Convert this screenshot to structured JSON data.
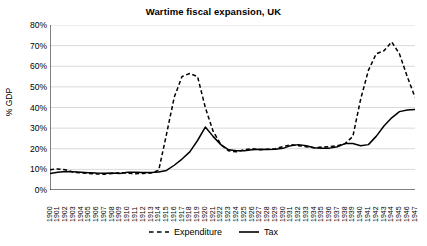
{
  "chart_data": {
    "type": "line",
    "title": "Wartime fiscal expansion, UK",
    "xlabel": "",
    "ylabel": "% GDP",
    "ylim": [
      0,
      80
    ],
    "ytick_step": 10,
    "ytick_labels": [
      "0%",
      "10%",
      "20%",
      "30%",
      "40%",
      "50%",
      "60%",
      "70%",
      "80%"
    ],
    "grid": "horizontal",
    "legend_position": "bottom",
    "x": [
      1900,
      1901,
      1902,
      1903,
      1904,
      1905,
      1906,
      1907,
      1908,
      1909,
      1910,
      1911,
      1912,
      1913,
      1914,
      1915,
      1916,
      1917,
      1918,
      1919,
      1920,
      1921,
      1922,
      1923,
      1924,
      1925,
      1926,
      1927,
      1928,
      1929,
      1930,
      1931,
      1932,
      1933,
      1934,
      1935,
      1936,
      1937,
      1938,
      1939,
      1940,
      1941,
      1942,
      1943,
      1944,
      1945,
      1946,
      1947
    ],
    "xtick_labels": [
      "1900",
      "1901",
      "1902",
      "1903",
      "1904",
      "1905",
      "1906",
      "1907",
      "1908",
      "1909",
      "1910",
      "1911",
      "1912",
      "1913",
      "1914",
      "1915",
      "1916",
      "1917",
      "1918",
      "1919",
      "1920",
      "1921",
      "1922",
      "1923",
      "1924",
      "1925",
      "1926",
      "1927",
      "1928",
      "1929",
      "1930",
      "1931",
      "1932",
      "1933",
      "1934",
      "1935",
      "1936",
      "1937",
      "1938",
      "1939",
      "1940",
      "1941",
      "1942",
      "1943",
      "1944",
      "1945",
      "1946",
      "1947"
    ],
    "series": [
      {
        "name": "Expenditure",
        "style": "dashed",
        "color": "#000000",
        "values": [
          9.8,
          10.2,
          9.8,
          8.6,
          8.3,
          8.0,
          7.8,
          7.6,
          8.0,
          8.4,
          8.2,
          7.9,
          8.0,
          8.2,
          9.5,
          27.0,
          45.0,
          55.0,
          56.5,
          55.0,
          40.0,
          28.5,
          22.0,
          19.0,
          18.5,
          19.5,
          20.0,
          19.5,
          19.8,
          20.0,
          21.0,
          22.0,
          21.5,
          21.0,
          20.5,
          20.8,
          21.0,
          21.5,
          22.5,
          26.0,
          44.0,
          58.0,
          66.0,
          67.5,
          71.8,
          66.0,
          55.0,
          45.0
        ]
      },
      {
        "name": "Tax",
        "style": "solid",
        "color": "#000000",
        "values": [
          8.0,
          8.6,
          9.0,
          8.8,
          8.6,
          8.4,
          8.2,
          8.1,
          8.2,
          8.0,
          8.6,
          8.6,
          8.5,
          8.5,
          8.7,
          9.5,
          12.0,
          15.0,
          18.5,
          24.0,
          30.5,
          26.0,
          22.0,
          19.5,
          19.0,
          19.0,
          19.5,
          19.8,
          19.6,
          19.8,
          20.2,
          21.5,
          22.0,
          21.5,
          20.5,
          20.2,
          20.3,
          21.0,
          22.5,
          22.5,
          21.5,
          22.0,
          26.0,
          31.0,
          35.0,
          38.0,
          38.8,
          39.0
        ]
      }
    ]
  }
}
